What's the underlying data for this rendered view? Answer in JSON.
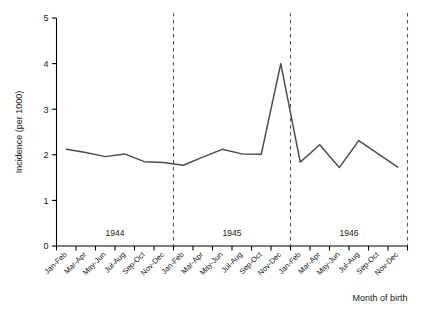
{
  "chart_data": {
    "type": "line",
    "title": "",
    "xlabel": "Month of birth",
    "ylabel": "Incidence (per 1000)",
    "ylim": [
      0,
      5
    ],
    "yticks": [
      0,
      1,
      2,
      3,
      4,
      5
    ],
    "grid": false,
    "legend": "none",
    "line_color": "#4d4d4d",
    "axis_color": "#000000",
    "separator_color": "#555555",
    "separator_style": "dashed",
    "categories": [
      "Jan-Feb",
      "Mar-Apr",
      "May-Jun",
      "Jul-Aug",
      "Sep-Oct",
      "Nov-Dec",
      "Jan-Feb",
      "Mar-Apr",
      "May-Jun",
      "Jul-Aug",
      "Sep-Oct",
      "Nov-Dec",
      "Jan-Feb",
      "Mar-Apr",
      "May-Jun",
      "Jul-Aug",
      "Sep-Oct",
      "Nov-Dec"
    ],
    "values": [
      2.12,
      2.05,
      1.96,
      2.02,
      1.85,
      1.83,
      1.77,
      1.95,
      2.12,
      2.02,
      2.01,
      4.0,
      1.84,
      2.22,
      1.72,
      2.31,
      2.02,
      1.73
    ],
    "year_groups": [
      {
        "label": "1944",
        "start_index": 0,
        "end_index": 5
      },
      {
        "label": "1945",
        "start_index": 6,
        "end_index": 11
      },
      {
        "label": "1946",
        "start_index": 12,
        "end_index": 17
      }
    ],
    "separators_after_index": [
      5,
      11,
      17
    ],
    "annotations": [
      {
        "text": "1944",
        "kind": "year-group-label"
      },
      {
        "text": "1945",
        "kind": "year-group-label"
      },
      {
        "text": "1946",
        "kind": "year-group-label"
      }
    ]
  },
  "axes": {
    "y_tick_labels": [
      "0",
      "1",
      "2",
      "3",
      "4",
      "5"
    ],
    "y_axis_title": "Incidence (per 1000)",
    "x_axis_title": "Month of birth"
  }
}
